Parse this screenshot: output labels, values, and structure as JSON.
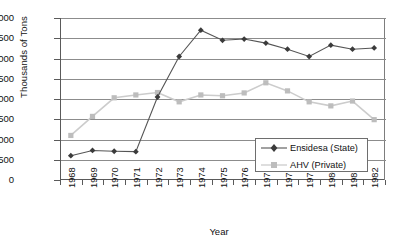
{
  "chart_data": {
    "type": "line",
    "title": "",
    "xlabel": "Year",
    "ylabel": "Thousands of Tons",
    "categories": [
      "1968",
      "1969",
      "1970",
      "1971",
      "1972",
      "1973",
      "1974",
      "1975",
      "1976",
      "1977",
      "1978",
      "1979",
      "1980",
      "1981",
      "1982"
    ],
    "ylim": [
      0,
      4000
    ],
    "ytick_labels": [
      "4,000",
      "3,500",
      "3,000",
      "2,500",
      "2,000",
      "1,500",
      "1,000",
      "500",
      "0"
    ],
    "ytick_values": [
      4000,
      3500,
      3000,
      2500,
      2000,
      1500,
      1000,
      500,
      0
    ],
    "grid": true,
    "legend_position": "bottom-right",
    "series": [
      {
        "name": "Ensidesa (State)",
        "marker": "diamond",
        "color": "#3b3b3b",
        "line_color": "#555555",
        "values": [
          600,
          730,
          710,
          700,
          2050,
          3050,
          3700,
          3450,
          3480,
          3380,
          3230,
          3050,
          3330,
          3230,
          3260
        ]
      },
      {
        "name": "AHV (Private)",
        "marker": "square",
        "color": "#bdbdbd",
        "line_color": "#cccccc",
        "values": [
          1100,
          1570,
          2030,
          2100,
          2160,
          1930,
          2100,
          2080,
          2150,
          2400,
          2200,
          1930,
          1830,
          1950,
          1490
        ]
      }
    ]
  },
  "legend": {
    "items": [
      {
        "label": "Ensidesa (State)"
      },
      {
        "label": "AHV (Private)"
      }
    ]
  }
}
